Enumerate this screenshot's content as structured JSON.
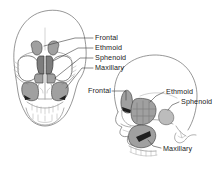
{
  "figure": {
    "background_color": "#ffffff",
    "line_color": "#6a6a6a",
    "shade_color": "#a0a0a0",
    "label_color": "#1a1a1a"
  },
  "views": {
    "anterior": {
      "name": "Anterior skull view",
      "labels": [
        {
          "id": "frontal",
          "text": "Frontal",
          "x": 95,
          "y": 35
        },
        {
          "id": "ethmoid",
          "text": "Ethmoid",
          "x": 95,
          "y": 45
        },
        {
          "id": "sphenoid",
          "text": "Sphenoid",
          "x": 95,
          "y": 55
        },
        {
          "id": "maxillary",
          "text": "Maxillary",
          "x": 95,
          "y": 65
        }
      ]
    },
    "lateral": {
      "name": "Lateral skull view",
      "labels": [
        {
          "id": "frontal",
          "text": "Frontal",
          "x": 89,
          "y": 88
        },
        {
          "id": "ethmoid",
          "text": "Ethmoid",
          "x": 166,
          "y": 89
        },
        {
          "id": "sphenoid",
          "text": "Sphenoid",
          "x": 181,
          "y": 99
        },
        {
          "id": "maxillary",
          "text": "Maxillary",
          "x": 163,
          "y": 146
        }
      ]
    }
  },
  "sinus_names": {
    "frontal": "Frontal sinus",
    "ethmoid": "Ethmoid sinus",
    "sphenoid": "Sphenoid sinus",
    "maxillary": "Maxillary sinus"
  }
}
